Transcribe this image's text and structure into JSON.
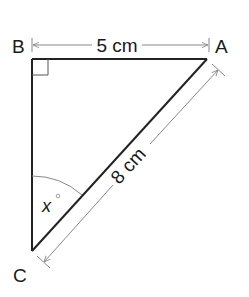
{
  "diagram": {
    "type": "right-triangle",
    "vertices": {
      "A": {
        "label": "A"
      },
      "B": {
        "label": "B"
      },
      "C": {
        "label": "C"
      }
    },
    "right_angle_at": "B",
    "sides": {
      "AB": {
        "label": "5 cm"
      },
      "AC": {
        "label": "8 cm"
      }
    },
    "angle": {
      "vertex": "C",
      "label": "x",
      "unit": "°"
    },
    "colors": {
      "line": "#222222",
      "dimension": "#888888",
      "text": "#1a1a1a"
    }
  }
}
